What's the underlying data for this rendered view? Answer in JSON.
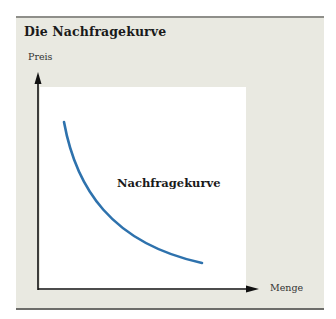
{
  "title": "Die Nachfragekurve",
  "axes": {
    "y_label": "Preis",
    "x_label": "Menge"
  },
  "curve_label": "Nachfragekurve",
  "colors": {
    "panel_bg": "#e9e9e1",
    "plot_bg": "#ffffff",
    "curve": "#2e72ad",
    "axis": "#111111"
  }
}
